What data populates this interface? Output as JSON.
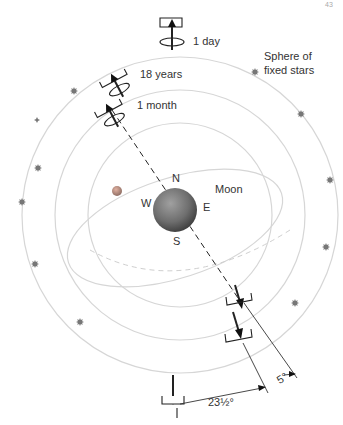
{
  "diagram": {
    "page_number": "43",
    "labels": {
      "day": "1 day",
      "years": "18 years",
      "month": "1 month",
      "sphere": "Sphere of",
      "sphere2": "fixed stars",
      "north": "N",
      "south": "S",
      "east": "E",
      "west": "W",
      "moon": "Moon",
      "angle_ecliptic": "23½°",
      "angle_moon": "5°"
    },
    "colors": {
      "orbit": "#d6d6d6",
      "star": "#777777",
      "earth": "#6e6e6e",
      "line": "#222222"
    }
  }
}
